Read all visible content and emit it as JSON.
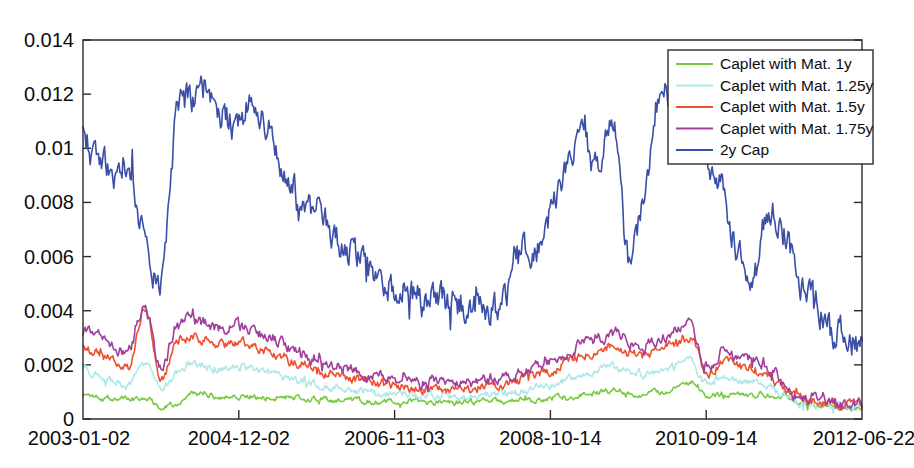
{
  "chart_data": {
    "type": "line",
    "title": "",
    "xlabel": "",
    "ylabel": "",
    "grid": false,
    "legend_position": "top-right",
    "ylim": [
      0,
      0.014
    ],
    "xlim": [
      0,
      1
    ],
    "ytick_labels": [
      "0.014",
      "0.012",
      "0.01",
      "0.008",
      "0.006",
      "0.004",
      "0.002",
      "0"
    ],
    "ytick_values": [
      0.014,
      0.012,
      0.01,
      0.008,
      0.006,
      0.004,
      0.002,
      0
    ],
    "xtick_labels": [
      "2003-01-02",
      "2004-12-02",
      "2006-11-03",
      "2008-10-14",
      "2010-09-14",
      "2012-06-22"
    ],
    "xtick_positions": [
      0.0,
      0.2,
      0.4,
      0.6,
      0.8,
      1.0
    ],
    "series": [
      {
        "name": "Caplet with Mat. 1y",
        "color": "#7ac943",
        "knots": [
          0.0009,
          0.00085,
          0.00078,
          0.00072,
          0.0008,
          0.00048,
          0.00062,
          0.00092,
          0.00088,
          0.00084,
          0.00086,
          0.00082,
          0.0008,
          0.00078,
          0.00076,
          0.00074,
          0.0007,
          0.00068,
          0.00066,
          0.00064,
          0.00062,
          0.00065,
          0.0006,
          0.00063,
          0.00058,
          0.00062,
          0.00066,
          0.00064,
          0.0007,
          0.00072,
          0.00078,
          0.00082,
          0.0009,
          0.00098,
          0.00105,
          0.00096,
          0.00092,
          0.001,
          0.00112,
          0.00135,
          0.0009,
          0.00096,
          0.00092,
          0.00088,
          0.0009,
          0.00086,
          0.0006,
          0.00052,
          0.00048,
          0.00044,
          0.00042
        ]
      },
      {
        "name": "Caplet with Mat. 1.25y",
        "color": "#aee8e8",
        "knots": [
          0.0018,
          0.0016,
          0.0014,
          0.0013,
          0.002,
          0.0011,
          0.0017,
          0.00205,
          0.00195,
          0.00185,
          0.0019,
          0.0018,
          0.00165,
          0.0015,
          0.0014,
          0.00128,
          0.00118,
          0.0011,
          0.00102,
          0.00096,
          0.0009,
          0.00088,
          0.00084,
          0.00086,
          0.0008,
          0.00084,
          0.0009,
          0.00092,
          0.001,
          0.00112,
          0.00128,
          0.00145,
          0.00162,
          0.0018,
          0.00192,
          0.00176,
          0.00168,
          0.0018,
          0.00196,
          0.0021,
          0.0013,
          0.0015,
          0.00142,
          0.00134,
          0.00126,
          0.00095,
          0.0006,
          0.00055,
          0.0005,
          0.00046,
          0.00044
        ]
      },
      {
        "name": "Caplet with Mat. 1.5y",
        "color": "#f0502f",
        "knots": [
          0.00265,
          0.0024,
          0.00215,
          0.002,
          0.00412,
          0.0015,
          0.0029,
          0.003,
          0.00288,
          0.00275,
          0.00282,
          0.00268,
          0.00248,
          0.00225,
          0.00205,
          0.00182,
          0.00168,
          0.00155,
          0.00142,
          0.00132,
          0.00124,
          0.0012,
          0.00114,
          0.00116,
          0.0011,
          0.00116,
          0.00124,
          0.0013,
          0.00142,
          0.0016,
          0.00182,
          0.00208,
          0.00232,
          0.00252,
          0.0027,
          0.00246,
          0.00236,
          0.00254,
          0.00278,
          0.003,
          0.0017,
          0.00208,
          0.00196,
          0.00182,
          0.00168,
          0.00112,
          0.0007,
          0.00064,
          0.00058,
          0.00052,
          0.0005
        ]
      },
      {
        "name": "Caplet with Mat. 1.75y",
        "color": "#a0409c",
        "knots": [
          0.00322,
          0.003,
          0.00272,
          0.00252,
          0.00408,
          0.00185,
          0.0035,
          0.00362,
          0.00348,
          0.00332,
          0.0034,
          0.00322,
          0.003,
          0.00272,
          0.00248,
          0.00222,
          0.00202,
          0.00188,
          0.00172,
          0.00158,
          0.00148,
          0.00142,
          0.00136,
          0.00138,
          0.0013,
          0.00136,
          0.00146,
          0.00154,
          0.00168,
          0.00188,
          0.00214,
          0.00244,
          0.00272,
          0.00296,
          0.00318,
          0.0029,
          0.00278,
          0.003,
          0.00326,
          0.00352,
          0.00196,
          0.00248,
          0.00232,
          0.00214,
          0.00196,
          0.00126,
          0.00078,
          0.0007,
          0.00064,
          0.00058,
          0.00055
        ]
      },
      {
        "name": "2y Cap",
        "color": "#3b4fa8",
        "knots": [
          0.0103,
          0.0096,
          0.0089,
          0.0095,
          0.00625,
          0.0053,
          0.0111,
          0.0118,
          0.01225,
          0.0113,
          0.01075,
          0.012,
          0.01055,
          0.0092,
          0.0083,
          0.0076,
          0.0068,
          0.0062,
          0.0056,
          0.0052,
          0.0048,
          0.00455,
          0.00435,
          0.00425,
          0.00415,
          0.0044,
          0.004,
          0.0043,
          0.0065,
          0.006,
          0.0076,
          0.0088,
          0.0106,
          0.0093,
          0.0109,
          0.006,
          0.0083,
          0.0121,
          0.01085,
          0.0112,
          0.0095,
          0.0086,
          0.0062,
          0.0051,
          0.0079,
          0.007,
          0.0052,
          0.0044,
          0.0035,
          0.003,
          0.0028
        ]
      }
    ]
  },
  "legend": {
    "entries": [
      {
        "label": "Caplet with Mat. 1y"
      },
      {
        "label": "Caplet with Mat. 1.25y"
      },
      {
        "label": "Caplet with Mat. 1.5y"
      },
      {
        "label": "Caplet with Mat. 1.75y"
      },
      {
        "label": "2y Cap"
      }
    ]
  },
  "colors": {
    "axis": "#2b2b2b",
    "text": "#0d0d0d",
    "background": "#ffffff",
    "series_1y": "#7ac943",
    "series_125y": "#aee8e8",
    "series_15y": "#f0502f",
    "series_175y": "#a0409c",
    "series_2ycap": "#3b4fa8"
  }
}
